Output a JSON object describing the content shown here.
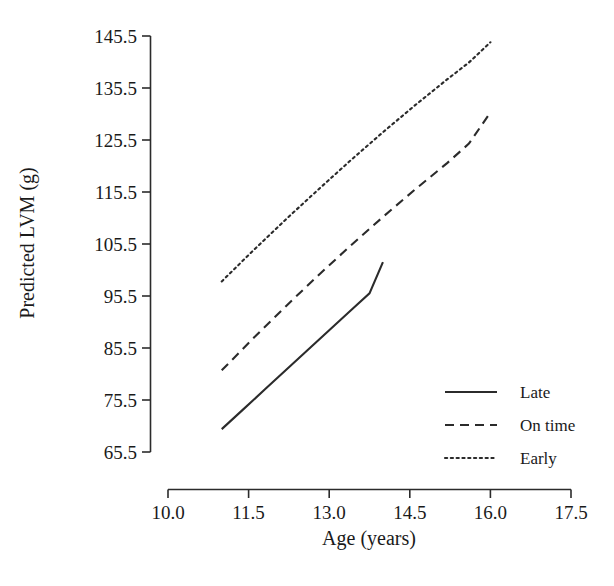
{
  "chart_data": {
    "type": "line",
    "title": "",
    "xlabel": "Age (years)",
    "ylabel": "Predicted LVM (g)",
    "xlim": [
      10.0,
      17.5
    ],
    "ylim": [
      65.5,
      145.5
    ],
    "xticks": [
      "10.0",
      "11.5",
      "13.0",
      "14.5",
      "16.0",
      "17.5"
    ],
    "xtick_values": [
      10.0,
      11.5,
      13.0,
      14.5,
      16.0,
      17.5
    ],
    "yticks": [
      "65.5",
      "75.5",
      "85.5",
      "95.5",
      "105.5",
      "115.5",
      "125.5",
      "135.5",
      "145.5"
    ],
    "ytick_values": [
      65.5,
      75.5,
      85.5,
      95.5,
      105.5,
      115.5,
      125.5,
      135.5,
      145.5
    ],
    "grid": false,
    "legend_position": "lower right",
    "series": [
      {
        "name": "Late",
        "style": "solid",
        "color": "#2b2b2b",
        "x": [
          11.0,
          11.4,
          11.8,
          12.2,
          12.6,
          13.0,
          13.4,
          13.75,
          14.0
        ],
        "values": [
          69.9,
          73.7,
          77.5,
          81.3,
          85.1,
          88.9,
          92.7,
          96.0,
          102.0
        ]
      },
      {
        "name": "On time",
        "style": "dashed",
        "color": "#2b2b2b",
        "x": [
          11.0,
          11.6,
          12.2,
          12.8,
          13.4,
          14.0,
          14.6,
          15.2,
          15.6,
          16.0
        ],
        "values": [
          81.2,
          87.5,
          93.6,
          99.5,
          105.2,
          110.7,
          116.0,
          121.1,
          124.8,
          130.8
        ]
      },
      {
        "name": "Early",
        "style": "dotted",
        "color": "#2b2b2b",
        "x": [
          11.0,
          11.6,
          12.2,
          12.8,
          13.4,
          14.0,
          14.6,
          15.2,
          15.6,
          16.0
        ],
        "values": [
          98.3,
          104.4,
          110.3,
          116.0,
          121.6,
          127.0,
          132.2,
          137.2,
          140.4,
          144.3
        ]
      }
    ]
  },
  "legend": {
    "items": [
      {
        "label": "Late",
        "style": "solid"
      },
      {
        "label": "On time",
        "style": "dashed"
      },
      {
        "label": "Early",
        "style": "dotted"
      }
    ]
  }
}
